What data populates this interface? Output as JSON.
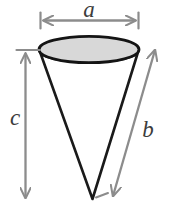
{
  "figure": {
    "name": "cone-dimension-diagram",
    "background_color": "#ffffff",
    "solid": {
      "name": "cone",
      "outline_color": "#1a1a1a",
      "top_face_fill": "#d8d8d8",
      "top_face_stroke": "#141414",
      "body_fill": "#ffffff"
    },
    "dimensions": [
      {
        "id": "a",
        "label": "a",
        "semantic": "diameter-of-top-circle",
        "orientation": "horizontal",
        "arrow_style": "double-headed",
        "color": "#8c8c8c",
        "label_color": "#3c3c3c",
        "label_font_size": "23px"
      },
      {
        "id": "c",
        "label": "c",
        "semantic": "height-of-cone",
        "orientation": "vertical",
        "arrow_style": "double-headed",
        "color": "#8c8c8c",
        "label_color": "#3c3c3c",
        "label_font_size": "23px"
      },
      {
        "id": "b",
        "label": "b",
        "semantic": "slant-height-of-cone",
        "orientation": "diagonal",
        "arrow_style": "double-headed",
        "color": "#8c8c8c",
        "label_color": "#3c3c3c",
        "label_font_size": "23px"
      }
    ]
  }
}
